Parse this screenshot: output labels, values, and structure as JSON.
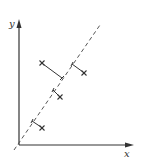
{
  "diagram": {
    "title": "",
    "axes": {
      "x_label": "x",
      "y_label": "y"
    },
    "line": {
      "style": "dashed",
      "color": "#555555"
    },
    "points": [
      {
        "id": "p1",
        "marker": "x-cross",
        "position": "above-left of line",
        "projection": "orthogonal"
      },
      {
        "id": "p2",
        "marker": "x-cross",
        "position": "below-right of line",
        "projection": "orthogonal"
      },
      {
        "id": "p3",
        "marker": "x-cross",
        "position": "below-right of line",
        "projection": "orthogonal"
      },
      {
        "id": "p4",
        "marker": "x-cross",
        "position": "below-right of line",
        "projection": "orthogonal"
      }
    ],
    "colors": {
      "ink": "#333333",
      "background": "#ffffff"
    }
  }
}
